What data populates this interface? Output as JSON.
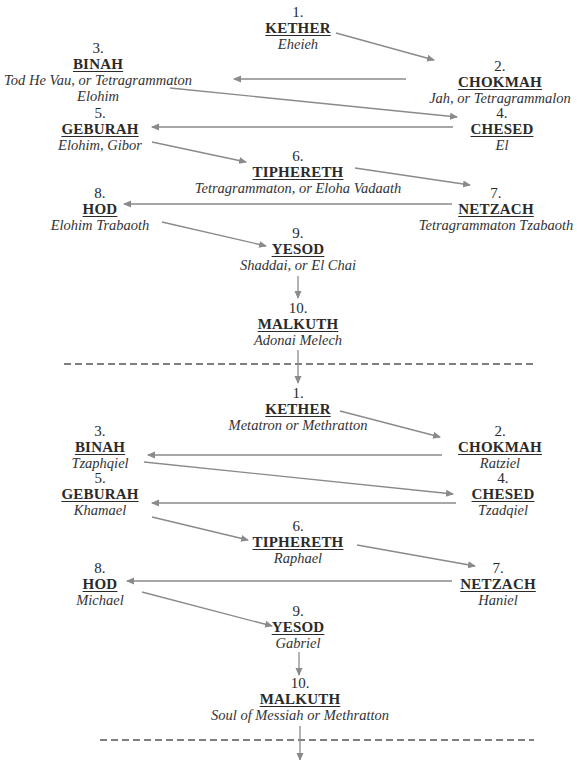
{
  "sections": [
    {
      "name": "divine-names",
      "nodes": [
        {
          "key": "kether",
          "number": "1.",
          "name": "KETHER",
          "sub": "Eheieh"
        },
        {
          "key": "chokmah",
          "number": "2.",
          "name": "CHOKMAH",
          "sub": "Jah, or Tetragrammalon"
        },
        {
          "key": "binah",
          "number": "3.",
          "name": "BINAH",
          "sub": "Tod He Vau, or Tetragrammaton",
          "sub2": "Elohim"
        },
        {
          "key": "chesed",
          "number": "4.",
          "name": "CHESED",
          "sub": "El"
        },
        {
          "key": "geburah",
          "number": "5.",
          "name": "GEBURAH",
          "sub": "Elohim, Gibor"
        },
        {
          "key": "tiphereth",
          "number": "6.",
          "name": "TIPHERETH",
          "sub": "Tetragrammaton, or Eloha Vadaath"
        },
        {
          "key": "netzach",
          "number": "7.",
          "name": "NETZACH",
          "sub": "Tetragrammaton Tzabaoth"
        },
        {
          "key": "hod",
          "number": "8.",
          "name": "HOD",
          "sub": "Elohim Trabaoth"
        },
        {
          "key": "yesod",
          "number": "9.",
          "name": "YESOD",
          "sub": "Shaddai, or El Chai"
        },
        {
          "key": "malkuth",
          "number": "10.",
          "name": "MALKUTH",
          "sub": "Adonai Melech"
        }
      ]
    },
    {
      "name": "archangels",
      "nodes": [
        {
          "key": "kether",
          "number": "1.",
          "name": "KETHER",
          "sub": "Metatron or Methratton"
        },
        {
          "key": "chokmah",
          "number": "2.",
          "name": "CHOKMAH",
          "sub": "Ratziel"
        },
        {
          "key": "binah",
          "number": "3.",
          "name": "BINAH",
          "sub": "Tzaphqiel"
        },
        {
          "key": "chesed",
          "number": "4.",
          "name": "CHESED",
          "sub": "Tzadqiel"
        },
        {
          "key": "geburah",
          "number": "5.",
          "name": "GEBURAH",
          "sub": "Khamael"
        },
        {
          "key": "tiphereth",
          "number": "6.",
          "name": "TIPHERETH",
          "sub": "Raphael"
        },
        {
          "key": "netzach",
          "number": "7.",
          "name": "NETZACH",
          "sub": "Haniel"
        },
        {
          "key": "hod",
          "number": "8.",
          "name": "HOD",
          "sub": "Michael"
        },
        {
          "key": "yesod",
          "number": "9.",
          "name": "YESOD",
          "sub": "Gabriel"
        },
        {
          "key": "malkuth",
          "number": "10.",
          "name": "MALKUTH",
          "sub": "Soul of Messiah or Methratton"
        }
      ]
    }
  ],
  "colors": {
    "arrow": "#8a8a8a",
    "text": "#2a2a2a",
    "divider": "#555555"
  }
}
